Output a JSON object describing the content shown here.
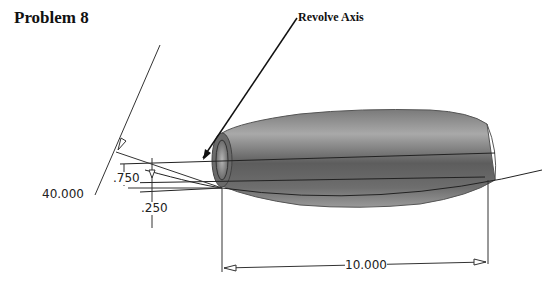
{
  "title": "Problem 8",
  "callout": {
    "label": "Revolve Axis"
  },
  "dimensions": {
    "angle": "40.000",
    "outer_offset": ".750",
    "inner_offset": ".250",
    "length": "10.000"
  },
  "colors": {
    "line": "#222222",
    "body_dark": "#4a4a4a",
    "body_light": "#a8a8a8"
  }
}
